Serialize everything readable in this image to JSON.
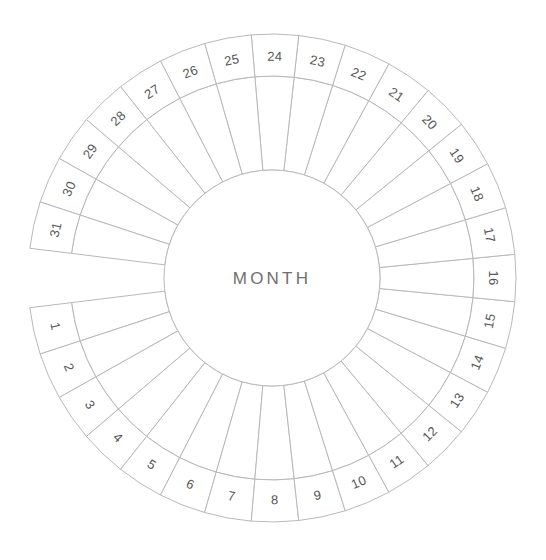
{
  "canvas": {
    "width": 546,
    "height": 560,
    "background": "#ffffff"
  },
  "wheel": {
    "title": "MONTH",
    "center": {
      "x": 272,
      "y": 278
    },
    "radii": {
      "outer": 244,
      "number_band_inner": 202,
      "hub": 108
    },
    "angles": {
      "start_deg": 187,
      "end_deg": 533,
      "gap_deg": 14
    },
    "colors": {
      "line": "#b9b9b9",
      "number_text": "#565656",
      "title_text": "#6f6f6f",
      "fill": "#ffffff"
    },
    "day_count": 31,
    "days": [
      {
        "n": 1,
        "label": "1"
      },
      {
        "n": 2,
        "label": "2"
      },
      {
        "n": 3,
        "label": "3"
      },
      {
        "n": 4,
        "label": "4"
      },
      {
        "n": 5,
        "label": "5"
      },
      {
        "n": 6,
        "label": "6"
      },
      {
        "n": 7,
        "label": "7"
      },
      {
        "n": 8,
        "label": "8"
      },
      {
        "n": 9,
        "label": "9"
      },
      {
        "n": 10,
        "label": "10"
      },
      {
        "n": 11,
        "label": "11"
      },
      {
        "n": 12,
        "label": "12"
      },
      {
        "n": 13,
        "label": "13"
      },
      {
        "n": 14,
        "label": "14"
      },
      {
        "n": 15,
        "label": "15"
      },
      {
        "n": 16,
        "label": "16"
      },
      {
        "n": 17,
        "label": "17"
      },
      {
        "n": 18,
        "label": "18"
      },
      {
        "n": 19,
        "label": "19"
      },
      {
        "n": 20,
        "label": "20"
      },
      {
        "n": 21,
        "label": "21"
      },
      {
        "n": 22,
        "label": "22"
      },
      {
        "n": 23,
        "label": "23"
      },
      {
        "n": 24,
        "label": "24"
      },
      {
        "n": 25,
        "label": "25"
      },
      {
        "n": 26,
        "label": "26"
      },
      {
        "n": 27,
        "label": "27"
      },
      {
        "n": 28,
        "label": "28"
      },
      {
        "n": 29,
        "label": "29"
      },
      {
        "n": 30,
        "label": "30"
      },
      {
        "n": 31,
        "label": "31"
      }
    ]
  }
}
